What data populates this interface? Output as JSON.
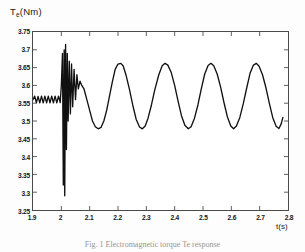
{
  "figure": {
    "caption": "Fig. 1   Electromagnetic torque Te response"
  },
  "chart_data": {
    "type": "line",
    "title": "",
    "ylabel": "Te(Nm)",
    "ylabel_base": "T",
    "ylabel_sub": "e",
    "ylabel_unit": "(Nm)",
    "xlabel": "t(s)",
    "xlim": [
      1.9,
      2.8
    ],
    "ylim": [
      3.25,
      3.75
    ],
    "grid": false,
    "legend": null,
    "line_color": "#111111",
    "xticks": [
      1.9,
      2.0,
      2.1,
      2.2,
      2.3,
      2.4,
      2.5,
      2.6,
      2.7,
      2.8
    ],
    "xtick_labels": [
      "1.9",
      "2",
      "2.1",
      "2.2",
      "2.3",
      "2.4",
      "2.5",
      "2.6",
      "2.7",
      "2.8"
    ],
    "yticks": [
      3.25,
      3.3,
      3.35,
      3.4,
      3.45,
      3.5,
      3.55,
      3.6,
      3.65,
      3.7,
      3.75
    ],
    "ytick_labels": [
      "3.25",
      "3.3",
      "3.35",
      "3.4",
      "3.45",
      "3.5",
      "3.55",
      "3.6",
      "3.65",
      "3.7",
      "3.75"
    ],
    "series": [
      {
        "name": "Te",
        "description": "Electromagnetic torque: small steady ripple near 3.56 Nm until t=2.0 s, then a large transient spike (3.29 to 3.715 Nm) with decaying ringing, settling into a sustained oscillation between 3.478 and 3.662 Nm with a period of about 0.163 s.",
        "prefault_mean": 3.56,
        "prefault_ripple_amplitude": 0.012,
        "fault_time": 2.0,
        "transient_min": 3.29,
        "transient_max": 3.715,
        "steady_peak": 3.662,
        "steady_trough": 3.478,
        "steady_mean": 3.57,
        "steady_period": 0.163,
        "points": [
          [
            1.9,
            3.56
          ],
          [
            1.906,
            3.57
          ],
          [
            1.912,
            3.552
          ],
          [
            1.918,
            3.569
          ],
          [
            1.924,
            3.551
          ],
          [
            1.93,
            3.57
          ],
          [
            1.936,
            3.551
          ],
          [
            1.942,
            3.57
          ],
          [
            1.948,
            3.551
          ],
          [
            1.954,
            3.57
          ],
          [
            1.96,
            3.551
          ],
          [
            1.966,
            3.57
          ],
          [
            1.972,
            3.551
          ],
          [
            1.978,
            3.57
          ],
          [
            1.984,
            3.551
          ],
          [
            1.99,
            3.57
          ],
          [
            1.996,
            3.552
          ],
          [
            2.0,
            3.6
          ],
          [
            2.004,
            3.69
          ],
          [
            2.007,
            3.32
          ],
          [
            2.01,
            3.7
          ],
          [
            2.012,
            3.29
          ],
          [
            2.015,
            3.715
          ],
          [
            2.018,
            3.42
          ],
          [
            2.021,
            3.69
          ],
          [
            2.024,
            3.5
          ],
          [
            2.028,
            3.668
          ],
          [
            2.032,
            3.52
          ],
          [
            2.036,
            3.66
          ],
          [
            2.04,
            3.54
          ],
          [
            2.045,
            3.645
          ],
          [
            2.05,
            3.56
          ],
          [
            2.055,
            3.63
          ],
          [
            2.06,
            3.59
          ],
          [
            2.066,
            3.612
          ],
          [
            2.072,
            3.6
          ],
          [
            2.08,
            3.59
          ],
          [
            2.09,
            3.56
          ],
          [
            2.1,
            3.53
          ],
          [
            2.11,
            3.5
          ],
          [
            2.12,
            3.484
          ],
          [
            2.13,
            3.478
          ],
          [
            2.14,
            3.482
          ],
          [
            2.15,
            3.5
          ],
          [
            2.16,
            3.53
          ],
          [
            2.17,
            3.57
          ],
          [
            2.18,
            3.61
          ],
          [
            2.19,
            3.645
          ],
          [
            2.2,
            3.66
          ],
          [
            2.21,
            3.662
          ],
          [
            2.218,
            3.655
          ],
          [
            2.228,
            3.63
          ],
          [
            2.24,
            3.59
          ],
          [
            2.252,
            3.545
          ],
          [
            2.264,
            3.505
          ],
          [
            2.276,
            3.483
          ],
          [
            2.286,
            3.478
          ],
          [
            2.296,
            3.486
          ],
          [
            2.306,
            3.508
          ],
          [
            2.318,
            3.545
          ],
          [
            2.33,
            3.588
          ],
          [
            2.344,
            3.63
          ],
          [
            2.356,
            3.655
          ],
          [
            2.366,
            3.662
          ],
          [
            2.376,
            3.657
          ],
          [
            2.388,
            3.636
          ],
          [
            2.4,
            3.6
          ],
          [
            2.412,
            3.556
          ],
          [
            2.424,
            3.515
          ],
          [
            2.436,
            3.488
          ],
          [
            2.448,
            3.478
          ],
          [
            2.458,
            3.484
          ],
          [
            2.47,
            3.508
          ],
          [
            2.482,
            3.545
          ],
          [
            2.494,
            3.59
          ],
          [
            2.506,
            3.632
          ],
          [
            2.518,
            3.656
          ],
          [
            2.528,
            3.662
          ],
          [
            2.538,
            3.655
          ],
          [
            2.55,
            3.632
          ],
          [
            2.562,
            3.596
          ],
          [
            2.574,
            3.552
          ],
          [
            2.586,
            3.512
          ],
          [
            2.598,
            3.486
          ],
          [
            2.608,
            3.478
          ],
          [
            2.618,
            3.486
          ],
          [
            2.63,
            3.51
          ],
          [
            2.642,
            3.548
          ],
          [
            2.654,
            3.592
          ],
          [
            2.666,
            3.634
          ],
          [
            2.678,
            3.657
          ],
          [
            2.688,
            3.662
          ],
          [
            2.698,
            3.654
          ],
          [
            2.71,
            3.63
          ],
          [
            2.722,
            3.594
          ],
          [
            2.734,
            3.55
          ],
          [
            2.746,
            3.51
          ],
          [
            2.758,
            3.485
          ],
          [
            2.768,
            3.479
          ],
          [
            2.776,
            3.492
          ],
          [
            2.782,
            3.51
          ]
        ]
      }
    ]
  }
}
